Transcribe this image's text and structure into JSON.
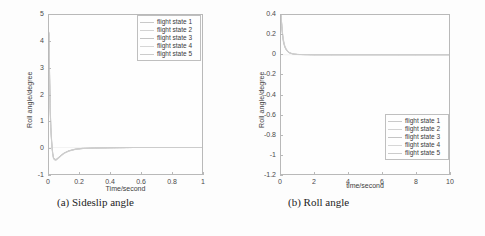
{
  "figure": {
    "background_color": "#fdfdfd",
    "axis_color": "#b9b9b9",
    "text_color": "#3c3c3c"
  },
  "panels": [
    {
      "id": "a",
      "caption": "(a) Sideslip angle",
      "ylabel": "Roll angle/degree",
      "xlabel": "Time/second",
      "yticks": [
        "5",
        "4",
        "3",
        "2",
        "1",
        "0",
        "-1"
      ],
      "xticks": [
        "0",
        "0.2",
        "0.4",
        "0.6",
        "0.8",
        "1"
      ],
      "legend_position": "top-right",
      "legend": [
        {
          "label": "flight state 1",
          "color": "#c9c9c9"
        },
        {
          "label": "flight state 2",
          "color": "#d2d2d2"
        },
        {
          "label": "flight state 3",
          "color": "#c4c4c4"
        },
        {
          "label": "flight state 4",
          "color": "#d6d6d6"
        },
        {
          "label": "flight state 5",
          "color": "#cbcbcb"
        }
      ]
    },
    {
      "id": "b",
      "caption": "(b) Roll angle",
      "ylabel": "Roll angle/degree",
      "xlabel": "time/second",
      "yticks": [
        "0.4",
        "0.2",
        "0",
        "-0.2",
        "-0.4",
        "-0.6",
        "-0.8",
        "-1",
        "-1.2"
      ],
      "xticks": [
        "0",
        "2",
        "4",
        "6",
        "8",
        "10"
      ],
      "legend_position": "bottom-right",
      "legend": [
        {
          "label": "flight state 1",
          "color": "#c9c9c9"
        },
        {
          "label": "flight state 2",
          "color": "#d2d2d2"
        },
        {
          "label": "flight state 3",
          "color": "#c4c4c4"
        },
        {
          "label": "flight state 4",
          "color": "#d6d6d6"
        },
        {
          "label": "flight state 5",
          "color": "#cbcbcb"
        }
      ]
    }
  ],
  "chart_data": [
    {
      "type": "line",
      "panel": "a",
      "title": "(a) Sideslip angle",
      "xlabel": "Time/second",
      "ylabel": "Roll angle/degree",
      "xlim": [
        0,
        1
      ],
      "ylim": [
        -1,
        5
      ],
      "xticks": [
        0,
        0.2,
        0.4,
        0.6,
        0.8,
        1
      ],
      "yticks": [
        -1,
        0,
        1,
        2,
        3,
        4,
        5
      ],
      "grid": false,
      "legend_position": "upper right",
      "series": [
        {
          "name": "flight state 1",
          "color": "#c9c9c9",
          "x": [
            0,
            0.004,
            0.008,
            0.012,
            0.018,
            0.024,
            0.03,
            0.04,
            0.05,
            0.065,
            0.08,
            0.1,
            0.13,
            0.17,
            0.22,
            0.3,
            0.4,
            0.55,
            0.7,
            0.85,
            1
          ],
          "y": [
            4.3,
            2.6,
            1.45,
            0.75,
            0.15,
            -0.22,
            -0.4,
            -0.47,
            -0.45,
            -0.38,
            -0.3,
            -0.21,
            -0.13,
            -0.07,
            -0.04,
            -0.02,
            -0.01,
            0.0,
            0.0,
            0.0,
            0.0
          ]
        },
        {
          "name": "flight state 2",
          "color": "#d2d2d2",
          "x": [
            0,
            0.004,
            0.008,
            0.012,
            0.018,
            0.024,
            0.03,
            0.04,
            0.05,
            0.065,
            0.08,
            0.1,
            0.13,
            0.17,
            0.22,
            0.3,
            0.4,
            0.55,
            0.7,
            0.85,
            1
          ],
          "y": [
            4.25,
            2.5,
            1.38,
            0.7,
            0.12,
            -0.24,
            -0.42,
            -0.48,
            -0.46,
            -0.39,
            -0.31,
            -0.22,
            -0.13,
            -0.07,
            -0.04,
            -0.02,
            -0.01,
            0.0,
            0.0,
            0.0,
            0.0
          ]
        },
        {
          "name": "flight state 3",
          "color": "#c4c4c4",
          "x": [
            0,
            0.004,
            0.008,
            0.012,
            0.018,
            0.024,
            0.03,
            0.04,
            0.05,
            0.065,
            0.08,
            0.1,
            0.13,
            0.17,
            0.22,
            0.3,
            0.4,
            0.55,
            0.7,
            0.85,
            1
          ],
          "y": [
            4.35,
            2.68,
            1.52,
            0.8,
            0.18,
            -0.2,
            -0.38,
            -0.45,
            -0.43,
            -0.36,
            -0.28,
            -0.2,
            -0.12,
            -0.06,
            -0.03,
            -0.02,
            -0.01,
            0.0,
            0.0,
            0.0,
            0.0
          ]
        },
        {
          "name": "flight state 4",
          "color": "#d6d6d6",
          "x": [
            0,
            0.004,
            0.008,
            0.012,
            0.018,
            0.024,
            0.03,
            0.04,
            0.05,
            0.065,
            0.08,
            0.1,
            0.13,
            0.17,
            0.22,
            0.3,
            0.4,
            0.55,
            0.7,
            0.85,
            1
          ],
          "y": [
            4.2,
            2.45,
            1.32,
            0.66,
            0.1,
            -0.26,
            -0.44,
            -0.5,
            -0.47,
            -0.4,
            -0.32,
            -0.22,
            -0.14,
            -0.08,
            -0.04,
            -0.02,
            -0.01,
            0.0,
            0.0,
            0.0,
            0.0
          ]
        },
        {
          "name": "flight state 5",
          "color": "#cbcbcb",
          "x": [
            0,
            0.004,
            0.008,
            0.012,
            0.018,
            0.024,
            0.03,
            0.04,
            0.05,
            0.065,
            0.08,
            0.1,
            0.13,
            0.17,
            0.22,
            0.3,
            0.4,
            0.55,
            0.7,
            0.85,
            1
          ],
          "y": [
            4.32,
            2.58,
            1.42,
            0.73,
            0.14,
            -0.23,
            -0.41,
            -0.46,
            -0.44,
            -0.37,
            -0.29,
            -0.21,
            -0.13,
            -0.07,
            -0.03,
            -0.02,
            -0.01,
            0.0,
            0.0,
            0.0,
            0.0
          ]
        }
      ]
    },
    {
      "type": "line",
      "panel": "b",
      "title": "(b) Roll angle",
      "xlabel": "time/second",
      "ylabel": "Roll angle/degree",
      "xlim": [
        0,
        10
      ],
      "ylim": [
        -1.2,
        0.4
      ],
      "xticks": [
        0,
        2,
        4,
        6,
        8,
        10
      ],
      "yticks": [
        -1.2,
        -1,
        -0.8,
        -0.6,
        -0.4,
        -0.2,
        0,
        0.2,
        0.4
      ],
      "grid": false,
      "legend_position": "lower right",
      "series": [
        {
          "name": "flight state 1",
          "color": "#c9c9c9",
          "x": [
            0,
            0.05,
            0.1,
            0.15,
            0.22,
            0.3,
            0.4,
            0.5,
            0.65,
            0.8,
            1.0,
            1.5,
            2,
            3,
            4,
            5,
            6,
            7,
            8,
            9,
            10
          ],
          "y": [
            0.4,
            0.28,
            0.19,
            0.13,
            0.085,
            0.055,
            0.032,
            0.02,
            0.011,
            0.006,
            0.003,
            0.001,
            0.0,
            0.0,
            0.0,
            0.0,
            0.0,
            0.0,
            0.0,
            0.0,
            0.0
          ]
        },
        {
          "name": "flight state 2",
          "color": "#d2d2d2",
          "x": [
            0,
            0.05,
            0.1,
            0.15,
            0.22,
            0.3,
            0.4,
            0.5,
            0.65,
            0.8,
            1.0,
            1.5,
            2,
            3,
            4,
            5,
            6,
            7,
            8,
            9,
            10
          ],
          "y": [
            0.4,
            0.29,
            0.2,
            0.14,
            0.09,
            0.06,
            0.035,
            0.022,
            0.012,
            0.007,
            0.003,
            0.001,
            0.0,
            0.0,
            0.0,
            0.0,
            0.0,
            0.0,
            0.0,
            0.0,
            0.0
          ]
        },
        {
          "name": "flight state 3",
          "color": "#c4c4c4",
          "x": [
            0,
            0.05,
            0.1,
            0.15,
            0.22,
            0.3,
            0.4,
            0.5,
            0.65,
            0.8,
            1.0,
            1.5,
            2,
            3,
            4,
            5,
            6,
            7,
            8,
            9,
            10
          ],
          "y": [
            0.4,
            0.27,
            0.18,
            0.12,
            0.078,
            0.05,
            0.029,
            0.018,
            0.01,
            0.005,
            0.002,
            0.001,
            0.0,
            0.0,
            0.0,
            0.0,
            0.0,
            0.0,
            0.0,
            0.0,
            0.0
          ]
        },
        {
          "name": "flight state 4",
          "color": "#d6d6d6",
          "x": [
            0,
            0.05,
            0.1,
            0.15,
            0.22,
            0.3,
            0.4,
            0.5,
            0.65,
            0.8,
            1.0,
            1.5,
            2,
            3,
            4,
            5,
            6,
            7,
            8,
            9,
            10
          ],
          "y": [
            0.4,
            0.3,
            0.21,
            0.15,
            0.095,
            0.063,
            0.038,
            0.024,
            0.013,
            0.007,
            0.003,
            0.001,
            0.0,
            0.0,
            0.0,
            0.0,
            0.0,
            0.0,
            0.0,
            0.0,
            0.0
          ]
        },
        {
          "name": "flight state 5",
          "color": "#cbcbcb",
          "x": [
            0,
            0.05,
            0.1,
            0.15,
            0.22,
            0.3,
            0.4,
            0.5,
            0.65,
            0.8,
            1.0,
            1.5,
            2,
            3,
            4,
            5,
            6,
            7,
            8,
            9,
            10
          ],
          "y": [
            0.4,
            0.285,
            0.195,
            0.135,
            0.087,
            0.057,
            0.033,
            0.021,
            0.011,
            0.006,
            0.003,
            0.001,
            0.0,
            0.0,
            0.0,
            0.0,
            0.0,
            0.0,
            0.0,
            0.0,
            0.0
          ]
        }
      ]
    }
  ]
}
